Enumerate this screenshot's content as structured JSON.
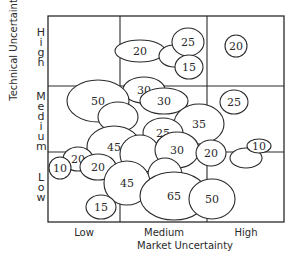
{
  "chart_data": {
    "type": "bubble-matrix",
    "title": "",
    "xlabel": "Market Uncertainty",
    "ylabel": "Technical Uncertainty",
    "x_categories": [
      "Low",
      "Medium",
      "High"
    ],
    "y_categories": [
      "Low",
      "Medium",
      "High"
    ],
    "grid": true,
    "bubbles": [
      {
        "label": "20",
        "x_cat": "Medium",
        "y_cat": "High",
        "cx": 140,
        "cy": 51,
        "rx": 25,
        "ry": 11
      },
      {
        "label": "",
        "cx": 174,
        "cy": 56,
        "rx": 15,
        "ry": 11
      },
      {
        "label": "25",
        "x_cat": "Medium",
        "y_cat": "High",
        "cx": 188,
        "cy": 42,
        "rx": 16,
        "ry": 14
      },
      {
        "label": "15",
        "x_cat": "Medium",
        "y_cat": "High",
        "cx": 189,
        "cy": 67,
        "rx": 14,
        "ry": 12
      },
      {
        "label": "20",
        "x_cat": "High",
        "y_cat": "High",
        "cx": 236,
        "cy": 46,
        "rx": 11,
        "ry": 11
      },
      {
        "label": "30",
        "x_cat": "Medium",
        "y_cat": "Medium",
        "cx": 144,
        "cy": 90,
        "rx": 21,
        "ry": 13
      },
      {
        "label": "30",
        "x_cat": "Medium",
        "y_cat": "Medium",
        "cx": 164,
        "cy": 101,
        "rx": 24,
        "ry": 13
      },
      {
        "label": "50",
        "x_cat": "Low",
        "y_cat": "Medium",
        "cx": 98,
        "cy": 101,
        "rx": 31,
        "ry": 21
      },
      {
        "label": "",
        "cx": 118,
        "cy": 117,
        "rx": 20,
        "ry": 15
      },
      {
        "label": "25",
        "x_cat": "High",
        "y_cat": "Medium",
        "cx": 234,
        "cy": 102,
        "rx": 14,
        "ry": 12
      },
      {
        "label": "35",
        "x_cat": "Medium",
        "y_cat": "Medium",
        "cx": 199,
        "cy": 124,
        "rx": 25,
        "ry": 20
      },
      {
        "label": "25",
        "x_cat": "Medium",
        "y_cat": "Medium",
        "cx": 163,
        "cy": 133,
        "rx": 20,
        "ry": 15
      },
      {
        "label": "45",
        "x_cat": "Low",
        "y_cat": "Medium",
        "cx": 114,
        "cy": 147,
        "rx": 27,
        "ry": 21
      },
      {
        "label": "",
        "cx": 140,
        "cy": 154,
        "rx": 20,
        "ry": 19
      },
      {
        "label": "30",
        "x_cat": "Medium",
        "y_cat": "Medium",
        "cx": 177,
        "cy": 150,
        "rx": 22,
        "ry": 18
      },
      {
        "label": "20",
        "x_cat": "High",
        "y_cat": "Low",
        "cx": 211,
        "cy": 153,
        "rx": 15,
        "ry": 13
      },
      {
        "label": "",
        "cx": 246,
        "cy": 158,
        "rx": 16,
        "ry": 10
      },
      {
        "label": "10",
        "x_cat": "High",
        "y_cat": "Low",
        "cx": 259,
        "cy": 146,
        "rx": 12,
        "ry": 7
      },
      {
        "label": "20",
        "x_cat": "Low",
        "y_cat": "Low",
        "cx": 78,
        "cy": 159,
        "rx": 15,
        "ry": 12
      },
      {
        "label": "10",
        "x_cat": "Low",
        "y_cat": "Low",
        "cx": 60,
        "cy": 168,
        "rx": 11,
        "ry": 11
      },
      {
        "label": "20",
        "x_cat": "Low",
        "y_cat": "Low",
        "cx": 98,
        "cy": 167,
        "rx": 18,
        "ry": 13
      },
      {
        "label": "",
        "cx": 165,
        "cy": 175,
        "rx": 17,
        "ry": 17
      },
      {
        "label": "45",
        "x_cat": "Medium",
        "y_cat": "Low",
        "cx": 127,
        "cy": 183,
        "rx": 23,
        "ry": 22
      },
      {
        "label": "65",
        "x_cat": "Medium",
        "y_cat": "Low",
        "cx": 174,
        "cy": 196,
        "rx": 34,
        "ry": 24
      },
      {
        "label": "50",
        "x_cat": "High",
        "y_cat": "Low",
        "cx": 212,
        "cy": 199,
        "rx": 23,
        "ry": 20
      },
      {
        "label": "15",
        "x_cat": "Low",
        "y_cat": "Low",
        "cx": 101,
        "cy": 207,
        "rx": 15,
        "ry": 12
      }
    ]
  },
  "axes": {
    "xlabel": "Market Uncertainty",
    "ylabel": "Technical Uncertainty",
    "xticks": [
      "Low",
      "Medium",
      "High"
    ],
    "yticks": {
      "high": [
        "H",
        "i",
        "g",
        "h"
      ],
      "medium": [
        "M",
        "e",
        "d",
        "i",
        "u",
        "m"
      ],
      "low": [
        "L",
        "o",
        "w"
      ]
    }
  },
  "colors": {
    "stroke": "#2a2a2a",
    "fill": "#ffffff"
  }
}
